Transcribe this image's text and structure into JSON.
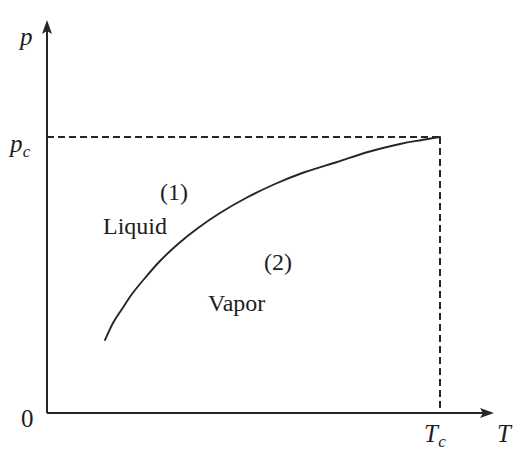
{
  "figure": {
    "type": "phase-diagram",
    "background_color": "#ffffff",
    "line_color": "#262626",
    "axes": {
      "y_axis": {
        "symbol": "p",
        "name": "pressure",
        "origin_label": "0",
        "arrow": "up",
        "x_px": 47,
        "top_px": 22,
        "bottom_px": 413
      },
      "x_axis": {
        "symbol": "T",
        "name": "temperature",
        "arrow": "right",
        "y_px": 413,
        "left_px": 47,
        "right_px": 492
      }
    },
    "tick_labels": {
      "critical_pressure": "p",
      "critical_pressure_sub": "c",
      "critical_temperature": "T",
      "critical_temperature_sub": "c"
    },
    "regions": [
      {
        "number": "(1)",
        "label": "Liquid"
      },
      {
        "number": "(2)",
        "label": "Vapor"
      }
    ],
    "guides": {
      "horizontal_dashed": {
        "y_px": 137,
        "from_x_px": 47,
        "to_x_px": 440
      },
      "vertical_dashed": {
        "x_px": 440,
        "from_y_px": 137,
        "to_y_px": 413
      },
      "dash_pattern": "7 4"
    }
  },
  "chart_data": {
    "type": "line",
    "title": "",
    "xlabel": "T",
    "ylabel": "p",
    "grid": false,
    "legend": null,
    "series": [
      {
        "name": "vaporization curve",
        "points_px": [
          [
            105,
            340
          ],
          [
            113,
            323
          ],
          [
            122,
            309
          ],
          [
            132,
            294
          ],
          [
            145,
            278
          ],
          [
            160,
            261
          ],
          [
            178,
            244
          ],
          [
            198,
            228
          ],
          [
            220,
            213
          ],
          [
            246,
            198
          ],
          [
            275,
            184
          ],
          [
            305,
            172
          ],
          [
            337,
            162
          ],
          [
            368,
            152
          ],
          [
            400,
            144
          ],
          [
            422,
            140
          ],
          [
            440,
            137
          ]
        ]
      }
    ],
    "annotations": [
      {
        "text": "(1)",
        "x_px": 178,
        "y_px": 193
      },
      {
        "text": "Liquid",
        "x_px": 137,
        "y_px": 228
      },
      {
        "text": "(2)",
        "x_px": 283,
        "y_px": 263
      },
      {
        "text": "Vapor",
        "x_px": 245,
        "y_px": 305
      }
    ],
    "critical_point_px": [
      440,
      137
    ]
  },
  "labels": {
    "p": "p",
    "p_c_base": "p",
    "p_c_sub": "c",
    "T": "T",
    "T_c_base": "T",
    "T_c_sub": "c",
    "origin": "0",
    "region_1": "(1)",
    "liquid": "Liquid",
    "region_2": "(2)",
    "vapor": "Vapor"
  }
}
